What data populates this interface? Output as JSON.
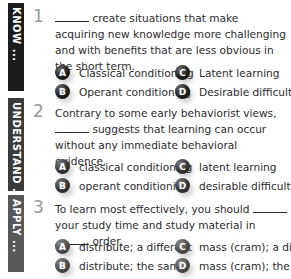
{
  "sections": [
    {
      "label": "KNOW ...",
      "color": "#1c1c1c",
      "number": "1",
      "question": {
        "blank_start": true,
        "text": "create situations that make acquiring new knowledge more challenging and with benefits that are less obvious in the short term."
      },
      "options": [
        {
          "letter": "A",
          "text": "Classical conditioning"
        },
        {
          "letter": "B",
          "text": "Operant conditioning"
        },
        {
          "letter": "C",
          "text": "Latent learning"
        },
        {
          "letter": "D",
          "text": "Desirable difficulties"
        }
      ]
    },
    {
      "label": "UNDERSTAND ...",
      "color": "#3b3b3b",
      "number": "2",
      "question": {
        "line1": "Contrary to some early behaviorist views,",
        "line2": "suggests that learning can occur without any immediate behavioral evidence."
      },
      "options": [
        {
          "letter": "A",
          "text": "classical conditioning"
        },
        {
          "letter": "B",
          "text": "operant conditioning"
        },
        {
          "letter": "C",
          "text": "latent learning"
        },
        {
          "letter": "D",
          "text": "desirable difficulties"
        }
      ]
    },
    {
      "label": "APPLY ...",
      "color": "#585858",
      "number": "3",
      "question": {
        "part1": "To learn most effectively, you should",
        "part2": "your study time and study material in",
        "part3": "order."
      },
      "options": [
        {
          "letter": "A",
          "text": "distribute; a different"
        },
        {
          "letter": "B",
          "text": "distribute; the same"
        },
        {
          "letter": "C",
          "text": "mass (cram); a different"
        },
        {
          "letter": "D",
          "text": "mass (cram); the same"
        }
      ]
    }
  ]
}
